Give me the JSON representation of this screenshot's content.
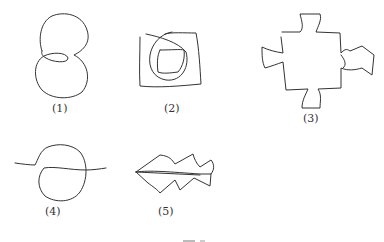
{
  "figures": [
    {
      "id": 1,
      "label": "(1)",
      "description": "figure-eight knot-like closed loop"
    },
    {
      "id": 2,
      "label": "(2)",
      "description": "spiral inside square frame"
    },
    {
      "id": 3,
      "label": "(3)",
      "description": "square with four bow-tie protrusions"
    },
    {
      "id": 4,
      "label": "(4)",
      "description": "loop crossing a horizontal line"
    },
    {
      "id": 5,
      "label": "(5)",
      "description": "zigzag arrow / fish-bone shape"
    }
  ],
  "stroke_color": "#333333",
  "caption": "图 1-"
}
